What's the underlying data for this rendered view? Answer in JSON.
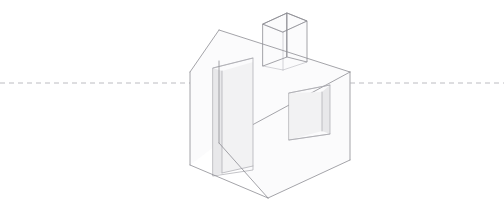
{
  "canvas": {
    "width": 504,
    "height": 212,
    "background": "#ffffff",
    "title": "One-point perspective house line drawing"
  },
  "style": {
    "line_color": "#8d8d93",
    "soft_line_color": "#a9a9af",
    "hidden_line_color": "#bcbcc2",
    "horizon_color": "#b4b4ba",
    "face_fill": "#fbfbfc",
    "opening_fill": "#f2f2f3",
    "reveal_fill": "#e8e8ea"
  },
  "horizon": {
    "label": "horizon line",
    "y": 83,
    "x_start": 0,
    "x_end": 504,
    "dash": "5 4"
  },
  "house": {
    "label": "house",
    "gable_wall": {
      "label": "left gable wall",
      "points": "190,72 219,30 219,143 190,165"
    },
    "front_wall": {
      "label": "right front wall",
      "points": "219,143 350,72 350,160 268,198"
    },
    "left_wall_band": {
      "label": "left wall side band",
      "points": "190,72 219,61 219,143 190,165"
    },
    "roof_plane": {
      "label": "roof slope",
      "points": "219,30 350,72 219,143"
    },
    "roof_left_slope": {
      "label": "roof left slope edge",
      "points": "190,72 219,30"
    },
    "roof_ridge": {
      "label": "roof ridge line",
      "points": "219,30 350,72"
    },
    "roof_eave": {
      "label": "roof eave line",
      "points": "219,143 350,72"
    },
    "corner_vertical": {
      "label": "front corner vertical",
      "points": "219,61 219,143"
    },
    "right_corner_vertical": {
      "label": "right corner vertical",
      "points": "350,72 350,160"
    },
    "left_corner_vertical": {
      "label": "left corner vertical",
      "points": "190,72 190,165"
    },
    "base_left": {
      "label": "base left edge",
      "points": "190,165 268,198"
    },
    "base_right": {
      "label": "base right edge",
      "points": "268,198 350,160"
    },
    "base_inner": {
      "label": "base inner edge",
      "points": "219,143 268,198"
    }
  },
  "chimney": {
    "label": "chimney",
    "front_face": "263,24 287,13 287,57 263,66",
    "right_face": "287,13 307,21 307,62 287,57",
    "top_face": "263,24 287,13 307,21 283,32",
    "hidden_back_vertical": "283,32 283,70",
    "hidden_back_top_left": "263,24 283,32",
    "hidden_back_top_right": "307,21 283,32",
    "base_line_left": "263,66 283,70",
    "base_line_right": "283,70 307,62"
  },
  "door": {
    "label": "recessed door opening",
    "opening": "213,68 253,58 253,170 213,176",
    "reveal_left": "213,68 222,71 222,173 213,176",
    "inner_panel": "222,71 253,62 253,166 222,173",
    "threshold": "222,173 253,166",
    "head_line": "213,68 253,58",
    "jamb_line": "222,71 222,173"
  },
  "window": {
    "label": "recessed window opening",
    "opening": "289,93 330,85 330,134 289,140",
    "reveal_right": "322,92 330,85 330,134 322,131",
    "reveal_bottom": "289,140 322,131 330,134 289,140",
    "inner_panel": "289,93 322,92 322,131 289,140",
    "sill_line": "289,140 330,134",
    "mullion_line": "322,92 322,131",
    "head_line": "289,93 330,85"
  },
  "vanishing": {
    "label": "vanishing point on horizon",
    "note": "edges converge toward the horizon line"
  }
}
